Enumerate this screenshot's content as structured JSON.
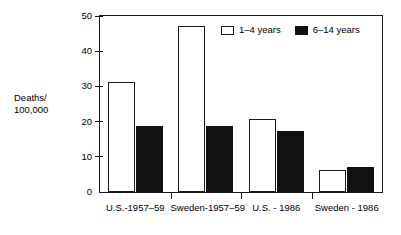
{
  "chart_data": {
    "type": "bar",
    "title": "",
    "xlabel": "",
    "ylabel": "Deaths/\n100,000",
    "ylabel_line1": "Deaths/",
    "ylabel_line2": "100,000",
    "ylim": [
      0,
      50
    ],
    "yticks": [
      0,
      10,
      20,
      30,
      40,
      50
    ],
    "ytick_labels": [
      "0",
      "10",
      "20",
      "30",
      "40",
      "50"
    ],
    "grid": false,
    "legend_position": "upper right (inside plot)",
    "categories": [
      "U.S.-1957–59",
      "Sweden-1957–59",
      "U.S. - 1986",
      "Sweden - 1986"
    ],
    "series": [
      {
        "name": "1–4 years",
        "color": "#ffffff",
        "edge_color": "#1a1a1a",
        "values": [
          31.3,
          47.2,
          20.7,
          6.3
        ]
      },
      {
        "name": "6–14 years",
        "color": "#111111",
        "edge_color": "#111111",
        "values": [
          18.8,
          18.8,
          17.3,
          7.0
        ]
      }
    ]
  },
  "legend": {
    "entries": [
      {
        "label": "1–4 years"
      },
      {
        "label": "6–14 years"
      }
    ]
  },
  "colors": {
    "background": "#ffffff",
    "axis": "#1a1a1a",
    "series_1_4_years": "#ffffff",
    "series_6_14_years": "#111111"
  }
}
